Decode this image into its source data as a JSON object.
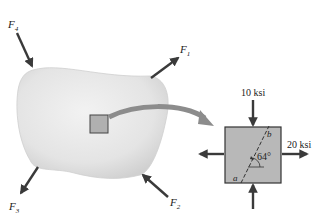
{
  "figure": {
    "body_forces": [
      {
        "label": "F",
        "sub": "1"
      },
      {
        "label": "F",
        "sub": "2"
      },
      {
        "label": "F",
        "sub": "3"
      },
      {
        "label": "F",
        "sub": "4"
      }
    ],
    "element": {
      "top_stress": "10 ksi",
      "right_stress": "20 ksi",
      "angle": "64°",
      "plane_point_a": "a",
      "plane_point_b": "b"
    }
  },
  "colors": {
    "body_fill": "#e6e6e6",
    "arrow": "#3a3a3a",
    "element_fill": "#b8b8b8",
    "transfer_arrow": "#8c8c8c"
  }
}
